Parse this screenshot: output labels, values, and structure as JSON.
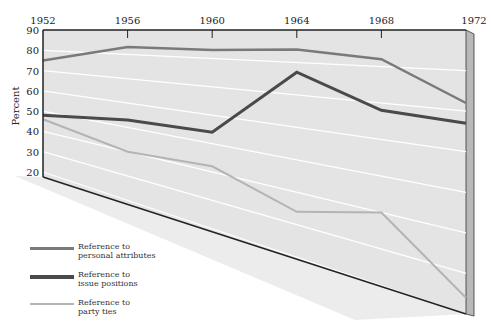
{
  "chart_data": {
    "type": "line",
    "title": "",
    "xlabel": "",
    "ylabel": "Percent",
    "x": [
      1952,
      1956,
      1960,
      1964,
      1968,
      1972
    ],
    "x_tick_labels": [
      "1952",
      "1956",
      "1960",
      "1964",
      "1968",
      "1972"
    ],
    "y_tick_labels": [
      "90",
      "80",
      "70",
      "60",
      "50",
      "40",
      "30",
      "20"
    ],
    "ylim": [
      20,
      90
    ],
    "grid": true,
    "perspective": "panel drawn in 3D perspective; gridlines fan out to the right",
    "legend_position": "bottom-left",
    "series": [
      {
        "name": "Reference to personal attributes",
        "color": "#7a7a7a",
        "values": [
          75,
          83,
          83,
          84,
          82,
          72
        ]
      },
      {
        "name": "Reference to issue positions",
        "color": "#4a4a4a",
        "values": [
          48,
          53,
          54,
          77,
          68,
          67
        ]
      },
      {
        "name": "Reference to party ties",
        "color": "#b4b4b4",
        "values": [
          46,
          40,
          42,
          34,
          40,
          24
        ]
      }
    ]
  },
  "legend": [
    {
      "line1": "Reference to",
      "line2": "personal attributes",
      "color": "#7a7a7a",
      "width": 3
    },
    {
      "line1": "Reference to",
      "line2": "issue positions",
      "color": "#4a4a4a",
      "width": 4
    },
    {
      "line1": "Reference to",
      "line2": "party ties",
      "color": "#b4b4b4",
      "width": 2
    }
  ],
  "colors": {
    "panel": "#e4e4e4",
    "shadow": "#ececec",
    "side": "#b8b8b8",
    "gridline": "#ffffff",
    "frame": "#222222"
  }
}
